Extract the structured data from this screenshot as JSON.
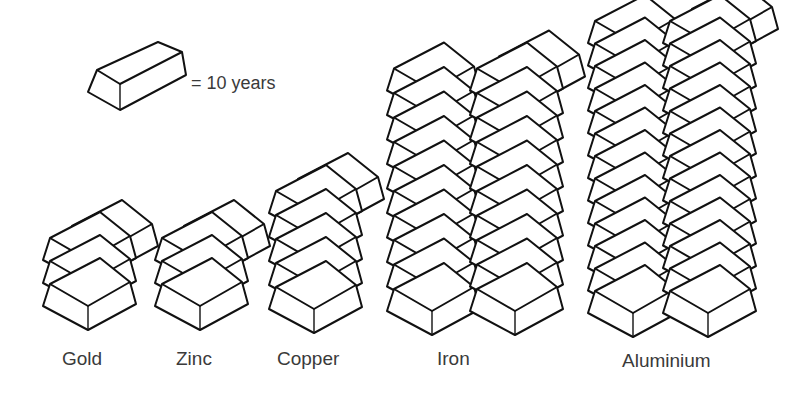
{
  "legend": {
    "icon": "ingot-icon",
    "text": "= 10 years",
    "unit_years_per_ingot": 10
  },
  "chart_data": {
    "type": "pictogram",
    "title": "",
    "unit": "1 ingot = 10 years",
    "categories": [
      "Gold",
      "Zinc",
      "Copper",
      "Iron",
      "Aluminium"
    ],
    "values_ingots": [
      3.5,
      3.5,
      5.5,
      21,
      27
    ],
    "values_years": [
      35,
      35,
      55,
      210,
      270
    ],
    "stacks": [
      {
        "label": "Gold",
        "columns": [
          3
        ],
        "top_partial": true
      },
      {
        "label": "Zinc",
        "columns": [
          3
        ],
        "top_partial": true
      },
      {
        "label": "Copper",
        "columns": [
          5
        ],
        "top_partial": true
      },
      {
        "label": "Iron",
        "columns": [
          10,
          10
        ],
        "top_partial": true
      },
      {
        "label": "Aluminium",
        "columns": [
          13,
          13
        ],
        "top_partial": true
      }
    ],
    "xlabel": "",
    "ylabel": "",
    "grid": false,
    "legend_position": "top-left"
  },
  "labels": {
    "gold": "Gold",
    "zinc": "Zinc",
    "copper": "Copper",
    "iron": "Iron",
    "aluminium": "Aluminium"
  },
  "colors": {
    "stroke": "#111111",
    "fill": "#ffffff",
    "text": "#3a3a3a"
  }
}
